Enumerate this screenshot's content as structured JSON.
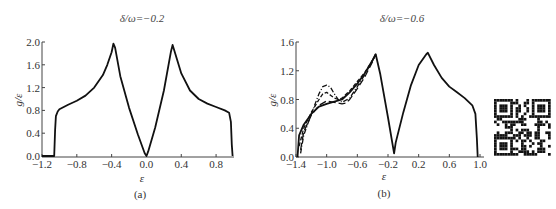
{
  "chart_data": [
    {
      "type": "line",
      "title": "δ/ω=−0.2",
      "panel_label": "(a)",
      "xlabel": "ε",
      "ylabel": "g/ε",
      "xlim": [
        -1.2,
        1.0
      ],
      "ylim": [
        0.0,
        2.0
      ],
      "xticks": [
        -1.2,
        -0.8,
        -0.4,
        0.0,
        0.4,
        0.8
      ],
      "xtick_labels": [
        "−1.2",
        "−0.8",
        "−0.4",
        "0.0",
        "0.4",
        "0.8"
      ],
      "yticks": [
        0.0,
        0.4,
        0.8,
        1.2,
        1.6,
        2.0
      ],
      "ytick_labels": [
        "0.0",
        "0.4",
        "0.8",
        "1.2",
        "1.6",
        "2.0"
      ],
      "grid": false,
      "series": [
        {
          "name": "curve",
          "style": "solid",
          "x": [
            -1.2,
            -1.06,
            -1.05,
            -1.04,
            -1.02,
            -1.0,
            -0.9,
            -0.8,
            -0.7,
            -0.6,
            -0.5,
            -0.45,
            -0.4,
            -0.38,
            -0.36,
            -0.3,
            -0.2,
            -0.1,
            -0.02,
            0.0,
            0.02,
            0.1,
            0.2,
            0.28,
            0.3,
            0.32,
            0.4,
            0.5,
            0.6,
            0.7,
            0.8,
            0.9,
            0.95,
            0.97,
            0.98,
            0.99
          ],
          "y": [
            0.0,
            0.0,
            0.45,
            0.7,
            0.78,
            0.82,
            0.9,
            0.97,
            1.06,
            1.2,
            1.42,
            1.6,
            1.82,
            1.97,
            1.9,
            1.4,
            0.85,
            0.38,
            0.05,
            0.0,
            0.08,
            0.5,
            1.15,
            1.82,
            1.95,
            1.85,
            1.45,
            1.15,
            1.0,
            0.92,
            0.86,
            0.8,
            0.76,
            0.6,
            0.2,
            0.0
          ]
        }
      ]
    },
    {
      "type": "line",
      "title": "δ/ω=−0.6",
      "panel_label": "(b)",
      "xlabel": "ε",
      "ylabel": "g/ε",
      "xlim": [
        -1.4,
        1.0
      ],
      "ylim": [
        0.0,
        1.6
      ],
      "xticks": [
        -1.4,
        -1.0,
        -0.6,
        -0.2,
        0.2,
        0.6,
        1.0
      ],
      "xtick_labels": [
        "−1.4",
        "−1.0",
        "−0.6",
        "−0.2",
        "0.2",
        "0.6",
        "1.0"
      ],
      "yticks": [
        0.0,
        0.4,
        0.8,
        1.2,
        1.6
      ],
      "ytick_labels": [
        "0.0",
        "0.4",
        "0.8",
        "1.2",
        "1.6"
      ],
      "grid": false,
      "series": [
        {
          "name": "solid",
          "style": "solid",
          "x": [
            -1.38,
            -1.36,
            -1.3,
            -1.2,
            -1.1,
            -1.0,
            -0.9,
            -0.8,
            -0.7,
            -0.6,
            -0.5,
            -0.4,
            -0.36,
            -0.3,
            -0.2,
            -0.12,
            -0.1,
            0.0,
            0.1,
            0.2,
            0.3,
            0.32,
            0.4,
            0.5,
            0.6,
            0.7,
            0.8,
            0.9,
            0.94,
            0.96,
            0.97
          ],
          "y": [
            0.0,
            0.3,
            0.45,
            0.6,
            0.7,
            0.74,
            0.77,
            0.8,
            0.9,
            1.02,
            1.17,
            1.35,
            1.43,
            1.15,
            0.55,
            0.05,
            0.2,
            0.62,
            1.0,
            1.28,
            1.43,
            1.45,
            1.28,
            1.1,
            0.98,
            0.9,
            0.82,
            0.72,
            0.6,
            0.25,
            0.0
          ]
        },
        {
          "name": "dash",
          "style": "dashed",
          "x": [
            -1.36,
            -1.3,
            -1.2,
            -1.1,
            -1.05,
            -1.0,
            -0.95,
            -0.9,
            -0.85,
            -0.8,
            -0.7,
            -0.6,
            -0.5,
            -0.4,
            -0.36
          ],
          "y": [
            0.15,
            0.4,
            0.62,
            0.8,
            0.88,
            0.9,
            0.86,
            0.82,
            0.8,
            0.82,
            0.92,
            1.05,
            1.18,
            1.35,
            1.43
          ]
        },
        {
          "name": "dash-dot",
          "style": "dashdot",
          "x": [
            -1.34,
            -1.3,
            -1.2,
            -1.1,
            -1.05,
            -1.0,
            -0.95,
            -0.9,
            -0.85,
            -0.8,
            -0.7,
            -0.6,
            -0.5,
            -0.4,
            -0.36
          ],
          "y": [
            0.05,
            0.3,
            0.6,
            0.88,
            0.98,
            1.0,
            0.97,
            0.88,
            0.8,
            0.76,
            0.82,
            0.98,
            1.15,
            1.35,
            1.43
          ]
        },
        {
          "name": "long-dash",
          "style": "longdash",
          "x": [
            -1.34,
            -1.3,
            -1.2,
            -1.1,
            -1.0,
            -0.9,
            -0.8,
            -0.75,
            -0.7,
            -0.6,
            -0.5,
            -0.4,
            -0.36
          ],
          "y": [
            0.1,
            0.35,
            0.58,
            0.72,
            0.78,
            0.76,
            0.74,
            0.75,
            0.8,
            0.95,
            1.12,
            1.33,
            1.43
          ]
        }
      ]
    }
  ],
  "qr_code": {
    "icon": "qr-code-icon"
  }
}
